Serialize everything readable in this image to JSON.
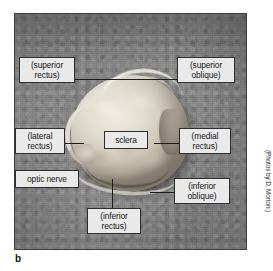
{
  "figure": {
    "part_label": "b",
    "photo_credit": "(Photos by D. Morton.)"
  },
  "colors": {
    "photo_background": "#8a8a8a",
    "label_fill": "#e9e9e9",
    "label_border": "#2e2e2e",
    "label_text": "#171717",
    "leader_line": "#1c1c1c",
    "sclera": "#e2ddd0"
  },
  "callouts": [
    {
      "id": "superior-rectus",
      "label": "(superior\nrectus)"
    },
    {
      "id": "superior-oblique",
      "label": "(superior\noblique)"
    },
    {
      "id": "lateral-rectus",
      "label": "(lateral\nrectus)"
    },
    {
      "id": "sclera",
      "label": "sclera"
    },
    {
      "id": "medial-rectus",
      "label": "(medial\nrectus)"
    },
    {
      "id": "optic-nerve",
      "label": "optic nerve"
    },
    {
      "id": "inferior-oblique",
      "label": "(inferior\noblique)"
    },
    {
      "id": "inferior-rectus",
      "label": "(inferior\nrectus)"
    }
  ]
}
